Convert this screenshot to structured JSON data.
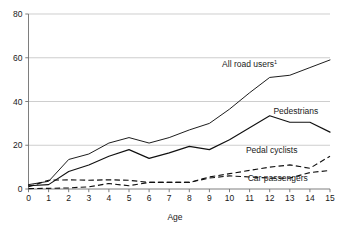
{
  "figure": {
    "clipped_top_text": "",
    "x_axis_title": "Age"
  },
  "chart_data": {
    "type": "line",
    "title": "",
    "xlabel": "Age",
    "ylabel": "",
    "xlim": [
      0,
      15
    ],
    "ylim": [
      0,
      80
    ],
    "yticks": [
      0,
      20,
      40,
      60,
      80
    ],
    "xticks": [
      0,
      1,
      2,
      3,
      4,
      5,
      6,
      7,
      8,
      9,
      10,
      11,
      12,
      13,
      14,
      15
    ],
    "grid": "horizontal",
    "legend_position": "inline-labels",
    "x": [
      0,
      1,
      2,
      3,
      4,
      5,
      6,
      7,
      8,
      9,
      10,
      11,
      12,
      13,
      14,
      15
    ],
    "series": [
      {
        "name": "All road users",
        "footnote_marker": "1",
        "style": "solid",
        "label_x": 11.0,
        "label_y": 56.0,
        "values": [
          2.0,
          3.5,
          13.5,
          16.0,
          21.0,
          23.5,
          21.0,
          23.5,
          27.0,
          30.0,
          36.5,
          44.0,
          51.0,
          52.0,
          55.5,
          59.0
        ]
      },
      {
        "name": "Pedestrians",
        "style": "solid",
        "label_x": 13.3,
        "label_y": 34.5,
        "values": [
          1.5,
          2.0,
          8.0,
          11.0,
          15.0,
          18.0,
          14.0,
          16.5,
          19.5,
          18.0,
          22.5,
          28.0,
          33.5,
          30.5,
          30.5,
          26.0
        ]
      },
      {
        "name": "Pedal cyclists",
        "style": "dashed",
        "label_x": 12.1,
        "label_y": 16.5,
        "values": [
          0.2,
          0.3,
          0.5,
          1.0,
          2.5,
          1.5,
          3.0,
          3.0,
          3.0,
          5.5,
          7.0,
          8.5,
          10.0,
          11.0,
          9.5,
          15.0
        ]
      },
      {
        "name": "Car passengers",
        "style": "dashed",
        "label_x": 12.4,
        "label_y": 3.8,
        "values": [
          1.0,
          4.0,
          4.2,
          4.0,
          4.2,
          4.0,
          3.0,
          3.0,
          3.0,
          5.0,
          6.0,
          5.5,
          5.0,
          5.0,
          7.5,
          8.5
        ]
      }
    ]
  }
}
